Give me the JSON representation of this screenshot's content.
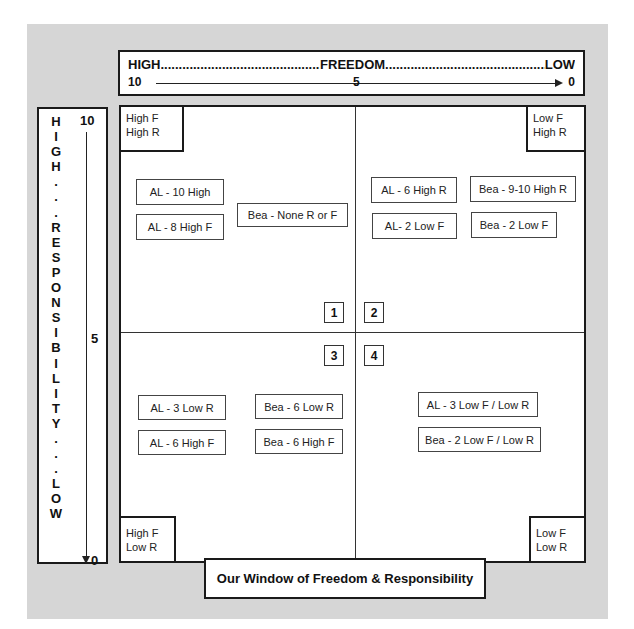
{
  "diagram": {
    "title": "Our Window of Freedom & Responsibility",
    "freedom_axis": {
      "high_label": "HIGH",
      "name": "FREEDOM",
      "low_label": "LOW",
      "dots_left": "....................................................................................................",
      "dots_right": "....................................................................................................",
      "scale_start": "10",
      "scale_mid": "5",
      "scale_end": "0"
    },
    "responsibility_axis": {
      "letters": [
        "H",
        "I",
        "G",
        "H",
        ".",
        ".",
        ".",
        "R",
        "E",
        "S",
        "P",
        "O",
        "N",
        "S",
        "I",
        "B",
        "I",
        "L",
        "I",
        "T",
        "Y",
        ".",
        ".",
        ".",
        "L",
        "O",
        "W"
      ],
      "vertical_text": "HIGH...RESPONSIBILITY...LOW",
      "scale_start": "10",
      "scale_mid": "5",
      "scale_end": "0"
    },
    "corners": {
      "top_left": [
        "High F",
        "High R"
      ],
      "top_right": [
        "Low F",
        "High R"
      ],
      "bottom_left": [
        "High F",
        "Low R"
      ],
      "bottom_right": [
        "Low F",
        "Low R"
      ]
    },
    "quadrants": [
      {
        "number": "1",
        "items": [
          "AL - 10 High",
          "AL - 8 High F",
          "Bea - None R or F"
        ]
      },
      {
        "number": "2",
        "items": [
          "AL - 6 High R",
          "Bea - 9-10 High R",
          "AL- 2 Low F",
          "Bea - 2 Low F"
        ]
      },
      {
        "number": "3",
        "items": [
          "AL - 3 Low R",
          "Bea - 6 Low R",
          "AL - 6 High F",
          "Bea - 6 High F"
        ]
      },
      {
        "number": "4",
        "items": [
          "AL - 3 Low F / Low R",
          "Bea - 2 Low F / Low R"
        ]
      }
    ]
  }
}
